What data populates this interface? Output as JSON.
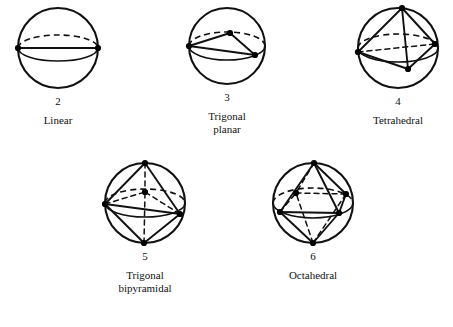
{
  "figure_caption_style": "molecular-geometry-sphere-diagrams",
  "colors": {
    "stroke": "#111111",
    "vertex": "#000000",
    "background": "#ffffff"
  },
  "figures": [
    {
      "id": "linear",
      "count_label": "2",
      "name_label": "Linear",
      "electron_domains": 2,
      "bond_angle_deg": 180,
      "sphere": {
        "cx": 58,
        "cy": 62,
        "r": 40,
        "equator_ry": 13
      },
      "vertices": [
        {
          "name": "left",
          "x": -40,
          "y": 0,
          "depth": "front"
        },
        {
          "name": "right",
          "x": 40,
          "y": 0,
          "depth": "front"
        }
      ],
      "edges": [
        {
          "from": "left",
          "to": "right",
          "style": "solid"
        }
      ]
    },
    {
      "id": "trigonal-planar",
      "count_label": "3",
      "name_label": "Trigonal\nplanar",
      "electron_domains": 3,
      "bond_angle_deg": 120,
      "sphere": {
        "cx": 227,
        "cy": 62,
        "r": 38,
        "equator_ry": 14
      },
      "vertices": [
        {
          "name": "left",
          "x": -38,
          "y": 0,
          "depth": "front"
        },
        {
          "name": "back",
          "x": 3,
          "y": -13,
          "depth": "back"
        },
        {
          "name": "front-right",
          "x": 28,
          "y": 9,
          "depth": "front"
        }
      ],
      "edges": [
        {
          "from": "left",
          "to": "back",
          "style": "solid"
        },
        {
          "from": "back",
          "to": "front-right",
          "style": "solid"
        },
        {
          "from": "left",
          "to": "front-right",
          "style": "solid"
        }
      ]
    },
    {
      "id": "tetrahedral",
      "count_label": "4",
      "name_label": "Tetrahedral",
      "electron_domains": 4,
      "bond_angle_deg": 109.5,
      "sphere": {
        "cx": 398,
        "cy": 60,
        "r": 40,
        "equator_ry": 14
      },
      "vertices": [
        {
          "name": "apex",
          "x": 4,
          "y": -40,
          "depth": "front"
        },
        {
          "name": "left",
          "x": -40,
          "y": 4,
          "depth": "front"
        },
        {
          "name": "right",
          "x": 37,
          "y": -4,
          "depth": "back"
        },
        {
          "name": "front",
          "x": 10,
          "y": 21,
          "depth": "front"
        }
      ],
      "edges": [
        {
          "from": "apex",
          "to": "left",
          "style": "solid"
        },
        {
          "from": "apex",
          "to": "right",
          "style": "solid"
        },
        {
          "from": "apex",
          "to": "front",
          "style": "solid"
        },
        {
          "from": "left",
          "to": "front",
          "style": "solid"
        },
        {
          "from": "right",
          "to": "front",
          "style": "solid"
        },
        {
          "from": "left",
          "to": "right",
          "style": "dashed"
        }
      ]
    },
    {
      "id": "trigonal-bipyramidal",
      "count_label": "5",
      "name_label": "Trigonal\nbipyramidal",
      "electron_domains": 5,
      "bond_angle_deg": 120,
      "sphere": {
        "cx": 145,
        "cy": 215,
        "r": 40,
        "equator_ry": 14
      },
      "vertices": [
        {
          "name": "top",
          "x": 0,
          "y": -40,
          "depth": "front"
        },
        {
          "name": "bottom",
          "x": -1,
          "y": 40,
          "depth": "front"
        },
        {
          "name": "left",
          "x": -40,
          "y": 1,
          "depth": "front"
        },
        {
          "name": "right",
          "x": 35,
          "y": 11,
          "depth": "front"
        },
        {
          "name": "back",
          "x": 0,
          "y": -11,
          "depth": "back"
        }
      ],
      "edges": [
        {
          "from": "top",
          "to": "left",
          "style": "solid"
        },
        {
          "from": "top",
          "to": "right",
          "style": "solid"
        },
        {
          "from": "top",
          "to": "back",
          "style": "dashed"
        },
        {
          "from": "bottom",
          "to": "left",
          "style": "solid"
        },
        {
          "from": "bottom",
          "to": "right",
          "style": "solid"
        },
        {
          "from": "bottom",
          "to": "back",
          "style": "dashed"
        },
        {
          "from": "left",
          "to": "right",
          "style": "solid"
        },
        {
          "from": "left",
          "to": "back",
          "style": "dashed"
        },
        {
          "from": "right",
          "to": "back",
          "style": "dashed"
        }
      ]
    },
    {
      "id": "octahedral",
      "count_label": "6",
      "name_label": "Octahedral",
      "electron_domains": 6,
      "bond_angle_deg": 90,
      "sphere": {
        "cx": 313,
        "cy": 215,
        "r": 40,
        "equator_ry": 15
      },
      "vertices": [
        {
          "name": "top",
          "x": 1,
          "y": -40,
          "depth": "front"
        },
        {
          "name": "bottom",
          "x": 0,
          "y": 40,
          "depth": "front"
        },
        {
          "name": "front-left",
          "x": -33,
          "y": 9,
          "depth": "front"
        },
        {
          "name": "front-right",
          "x": 26,
          "y": 10,
          "depth": "front"
        },
        {
          "name": "back-left",
          "x": -17,
          "y": -10,
          "depth": "back"
        },
        {
          "name": "back-right",
          "x": 33,
          "y": -9,
          "depth": "back"
        }
      ],
      "edges": [
        {
          "from": "top",
          "to": "front-left",
          "style": "solid"
        },
        {
          "from": "top",
          "to": "front-right",
          "style": "solid"
        },
        {
          "from": "top",
          "to": "back-left",
          "style": "dashed"
        },
        {
          "from": "top",
          "to": "back-right",
          "style": "solid"
        },
        {
          "from": "bottom",
          "to": "front-left",
          "style": "solid"
        },
        {
          "from": "bottom",
          "to": "front-right",
          "style": "solid"
        },
        {
          "from": "bottom",
          "to": "back-left",
          "style": "dashed"
        },
        {
          "from": "bottom",
          "to": "back-right",
          "style": "dashed"
        },
        {
          "from": "front-left",
          "to": "front-right",
          "style": "solid"
        },
        {
          "from": "front-left",
          "to": "back-left",
          "style": "dashed"
        },
        {
          "from": "front-right",
          "to": "back-right",
          "style": "solid"
        },
        {
          "from": "back-left",
          "to": "back-right",
          "style": "dashed"
        }
      ]
    }
  ],
  "layout": {
    "rows": [
      {
        "figures": [
          "linear",
          "trigonal-planar",
          "tetrahedral"
        ],
        "top": 8
      },
      {
        "figures": [
          "trigonal-bipyramidal",
          "octahedral"
        ],
        "top": 163
      }
    ]
  }
}
